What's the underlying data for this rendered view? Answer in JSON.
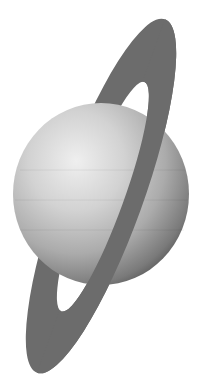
{
  "image": {
    "subject": "Ringed planet (Uranus-like) illustration",
    "background_color": "#ffffff"
  },
  "planet": {
    "label": "planet",
    "highlight_color": "#ececec",
    "mid_color": "#b4b4b4",
    "shadow_color": "#4a4a4a"
  },
  "ring": {
    "label": "ring",
    "color": "#6c6c6c"
  }
}
